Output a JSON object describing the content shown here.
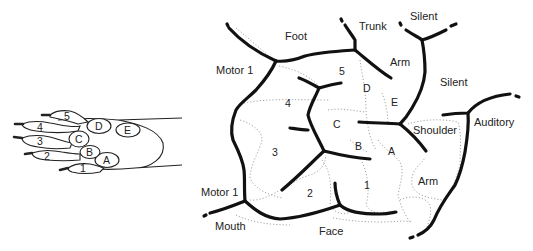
{
  "paw": {
    "digits": [
      "1",
      "2",
      "3",
      "4",
      "5"
    ],
    "pads": [
      "A",
      "B",
      "C",
      "D",
      "E"
    ]
  },
  "cortex": {
    "regions": {
      "foot": "Foot",
      "trunk": "Trunk",
      "silent_top": "Silent",
      "motor1_top": "Motor 1",
      "arm_top": "Arm",
      "silent_right": "Silent",
      "shoulder": "Shoulder",
      "auditory": "Auditory",
      "arm_bottom": "Arm",
      "motor1_bottom": "Motor 1",
      "mouth": "Mouth",
      "face": "Face"
    },
    "digit_areas": {
      "d1": "1",
      "d2": "2",
      "d3": "3",
      "d4": "4",
      "d5": "5"
    },
    "pad_areas": {
      "a": "A",
      "b": "B",
      "c": "C",
      "d": "D",
      "e": "E"
    }
  }
}
